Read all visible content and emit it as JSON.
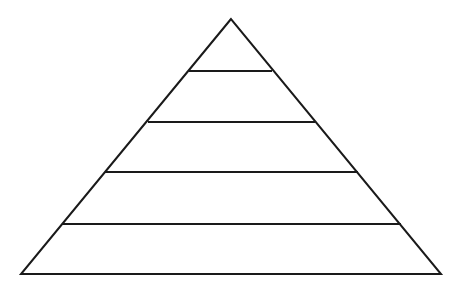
{
  "diagram": {
    "type": "pyramid",
    "levels": 5,
    "stroke_color": "#1a1a1a",
    "background": "#ffffff",
    "apex": [
      231,
      19
    ],
    "base_left": [
      21,
      274
    ],
    "base_right": [
      441,
      274
    ],
    "divider_lines": [
      {
        "y": 71,
        "x1": 189,
        "x2": 272
      },
      {
        "y": 122,
        "x1": 148,
        "x2": 315
      },
      {
        "y": 172,
        "x1": 105,
        "x2": 358
      },
      {
        "y": 224,
        "x1": 62,
        "x2": 401
      }
    ],
    "level_labels": [
      "",
      "",
      "",
      "",
      ""
    ]
  }
}
